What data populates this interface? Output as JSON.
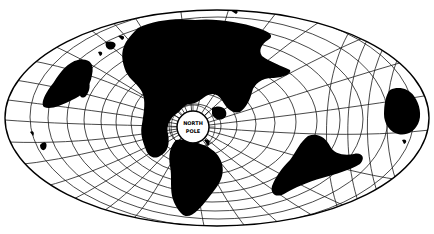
{
  "map": {
    "projection": "oblique equal-area world map centered on the North Pole",
    "pole_label_top": "NORTH",
    "pole_label_bottom": "POLE",
    "colors": {
      "land": "#000000",
      "ocean": "#ffffff",
      "graticule": "#1a1a1a"
    },
    "ellipse": {
      "cx": 217,
      "cy": 118,
      "rx": 212,
      "ry": 108
    },
    "pole": {
      "cx": 193,
      "cy": 127,
      "r": 16
    }
  }
}
